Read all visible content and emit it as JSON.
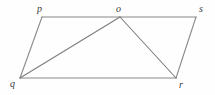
{
  "figure": {
    "type": "geometric-diagram",
    "background_color": "#fefefe",
    "width": 215,
    "height": 95,
    "vertices": [
      {
        "id": "p",
        "label": "p",
        "x": 42,
        "y": 17,
        "label_x": 37,
        "label_y": 4
      },
      {
        "id": "o",
        "label": "o",
        "x": 120,
        "y": 17,
        "label_x": 116,
        "label_y": 4
      },
      {
        "id": "s",
        "label": "s",
        "x": 196,
        "y": 17,
        "label_x": 199,
        "label_y": 4
      },
      {
        "id": "q",
        "label": "q",
        "x": 20,
        "y": 78,
        "label_x": 10,
        "label_y": 79
      },
      {
        "id": "r",
        "label": "r",
        "x": 176,
        "y": 78,
        "label_x": 179,
        "label_y": 80
      }
    ],
    "edges": [
      {
        "id": "p-o",
        "from": "p",
        "to": "o",
        "color": "#b0b0b0",
        "width": 1.6
      },
      {
        "id": "o-s",
        "from": "o",
        "to": "s",
        "color": "#b0b0b0",
        "width": 1.6
      },
      {
        "id": "q-r",
        "from": "q",
        "to": "r",
        "color": "#b0b0b0",
        "width": 1.6
      },
      {
        "id": "p-q",
        "from": "p",
        "to": "q",
        "color": "#8a8a8a",
        "width": 1.1
      },
      {
        "id": "s-r",
        "from": "s",
        "to": "r",
        "color": "#8a8a8a",
        "width": 1.1
      },
      {
        "id": "q-o",
        "from": "q",
        "to": "o",
        "color": "#7d7d7d",
        "width": 1.1
      },
      {
        "id": "o-r",
        "from": "o",
        "to": "r",
        "color": "#7d7d7d",
        "width": 1.1
      }
    ],
    "colors": {
      "outline_light": "#b0b0b0",
      "outline_dark": "#7d7d7d",
      "label": "#3a3a3a"
    }
  }
}
